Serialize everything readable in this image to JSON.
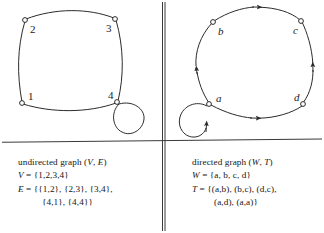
{
  "figure": {
    "title_hidden": "",
    "dividers": {
      "vertical_x": 163,
      "horizontal_y": 141
    }
  },
  "left_panel": {
    "name": "undirected-graph-panel",
    "graph": {
      "type": "undirected",
      "nodes": [
        {
          "id": "1",
          "label": "1",
          "cx": 22,
          "cy": 103,
          "label_dx": 6,
          "label_dy": -3
        },
        {
          "id": "2",
          "label": "2",
          "cx": 25,
          "cy": 20,
          "label_dx": 5,
          "label_dy": 13
        },
        {
          "id": "3",
          "label": "3",
          "cx": 115,
          "cy": 19,
          "label_dx": -9,
          "label_dy": 13
        },
        {
          "id": "4",
          "label": "4",
          "cx": 117,
          "cy": 102,
          "label_dx": -9,
          "label_dy": -3
        }
      ],
      "edges": [
        {
          "from": "1",
          "to": "2"
        },
        {
          "from": "2",
          "to": "3"
        },
        {
          "from": "3",
          "to": "4"
        },
        {
          "from": "4",
          "to": "1"
        },
        {
          "from": "4",
          "to": "4",
          "self_loop": true
        }
      ]
    },
    "caption": {
      "line1": "undirected graph (V, E)",
      "line1_plain": "undirected graph (",
      "line1_v": "V",
      "line1_comma": ", ",
      "line1_e": "E",
      "line1_close": ")",
      "line2_var": "V",
      "line2_rest": " = {1,2,3,4}",
      "line3_var": "E",
      "line3_rest": " = {{1,2}, {2,3}, {3,4},",
      "line4_rest": "{4,1}, {4,4}}"
    }
  },
  "right_panel": {
    "name": "directed-graph-panel",
    "graph": {
      "type": "directed",
      "nodes": [
        {
          "id": "a",
          "label": "a",
          "cx": 209,
          "cy": 104,
          "label_dx": 7,
          "label_dy": -3
        },
        {
          "id": "b",
          "label": "b",
          "cx": 213,
          "cy": 22,
          "label_dx": 5,
          "label_dy": 13
        },
        {
          "id": "c",
          "label": "c",
          "cx": 301,
          "cy": 21,
          "label_dx": -9,
          "label_dy": 13
        },
        {
          "id": "d",
          "label": "d",
          "cx": 303,
          "cy": 104,
          "label_dx": -9,
          "label_dy": -3
        }
      ],
      "edges": [
        {
          "from": "a",
          "to": "b",
          "arrow": "up"
        },
        {
          "from": "b",
          "to": "c",
          "arrow": "right"
        },
        {
          "from": "d",
          "to": "c",
          "arrow": "up"
        },
        {
          "from": "a",
          "to": "d",
          "arrow": "right"
        },
        {
          "from": "a",
          "to": "a",
          "self_loop": true,
          "arrow": "up"
        }
      ]
    },
    "caption": {
      "line1_plain": "directed graph (",
      "line1_w": "W",
      "line1_comma": ", ",
      "line1_t": "T",
      "line1_close": ")",
      "line2_var": "W",
      "line2_rest": " = {a, b, c, d}",
      "line3_var": "T",
      "line3_rest": " = {(a,b), (b,c), (d,c),",
      "line4_rest": "(a,d), (a,a)}"
    }
  },
  "colors": {
    "ink": "#1a1a1a",
    "line": "#2b2b2b",
    "background": "#ffffff"
  }
}
